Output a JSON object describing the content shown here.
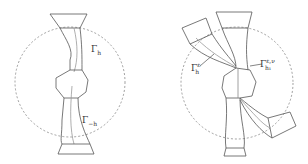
{
  "figure": {
    "left_panel": {
      "labels": {
        "gamma_h": {
          "base": "Γ",
          "sub": "h"
        },
        "gamma_minus_h": {
          "base": "Γ",
          "sub": "−h"
        }
      }
    },
    "right_panel": {
      "labels": {
        "gamma_eps_h": {
          "base": "Γ",
          "sup": "ε",
          "sub": "h"
        },
        "gamma_eps_nu_h1": {
          "base": "Γ",
          "sup": "ε,ν",
          "sub": "h₁"
        }
      }
    },
    "colors": {
      "stroke": "#555555",
      "dashed_circle": "#888888",
      "inner_curve": "#999999"
    }
  }
}
